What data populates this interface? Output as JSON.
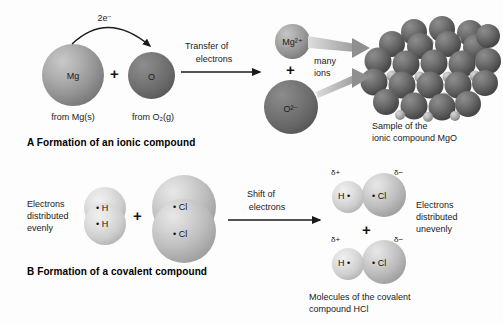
{
  "figure": {
    "panel_a": {
      "caption": "A  Formation of an ionic compound",
      "reactants": {
        "mg_symbol": "Mg",
        "o_symbol": "O",
        "mg_source": "from Mg(s)",
        "o_source": "from O₂(g)",
        "electron_label": "2e⁻",
        "plus": "+"
      },
      "arrow": {
        "bold_word": "Transfer",
        "rest": " of",
        "line2": "electrons"
      },
      "products": {
        "mg_ion": "Mg²⁺",
        "o_ion": "O²⁻",
        "plus": "+",
        "many_ions_line1": "many",
        "many_ions_line2": "ions"
      },
      "crystal": {
        "label_line1": "Sample of the",
        "label_line2": "ionic compound MgO"
      }
    },
    "panel_b": {
      "caption": "B  Formation of a covalent compound",
      "reactants": {
        "even_line1": "Electrons",
        "even_line2": "distributed",
        "even_line3": "evenly",
        "h_symbol": "H",
        "cl_symbol": "Cl",
        "plus": "+"
      },
      "arrow": {
        "bold_word": "Shift",
        "rest": " of",
        "line2": "electrons"
      },
      "products": {
        "h_symbol": "H",
        "cl_symbol": "Cl",
        "delta_plus": "δ+",
        "delta_minus": "δ−",
        "plus": "+",
        "uneven_line1": "Electrons",
        "uneven_line2": "distributed",
        "uneven_line3": "unevenly",
        "caption_line1": "Molecules of the covalent",
        "caption_line2": "compound HCl"
      }
    }
  },
  "colors": {
    "background": "#fdfdfd",
    "text": "#111111",
    "arrow": "#1a1a1a",
    "taper_arrow": "#b9b9b9",
    "sphere_light": "#d9d9d9",
    "sphere_mid": "#9a9a9a",
    "sphere_dark": "#5c5c5c"
  }
}
